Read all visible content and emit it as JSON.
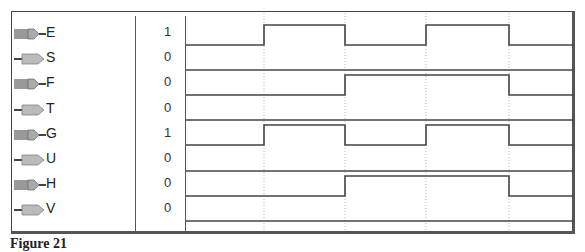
{
  "signals": [
    {
      "name": "E",
      "type": "input",
      "value": "1",
      "wave": [
        0,
        1,
        0,
        1,
        0
      ]
    },
    {
      "name": "S",
      "type": "output",
      "value": "0",
      "wave": [
        0,
        0,
        0,
        0,
        0
      ]
    },
    {
      "name": "F",
      "type": "input",
      "value": "0",
      "wave": [
        0,
        0,
        1,
        1,
        0
      ]
    },
    {
      "name": "T",
      "type": "output",
      "value": "0",
      "wave": [
        0,
        0,
        0,
        0,
        0
      ]
    },
    {
      "name": "G",
      "type": "input",
      "value": "1",
      "wave": [
        0,
        1,
        0,
        1,
        0
      ]
    },
    {
      "name": "U",
      "type": "output",
      "value": "0",
      "wave": [
        0,
        0,
        0,
        0,
        0
      ]
    },
    {
      "name": "H",
      "type": "input",
      "value": "0",
      "wave": [
        0,
        0,
        1,
        1,
        0
      ]
    },
    {
      "name": "V",
      "type": "output",
      "value": "0",
      "wave": [
        0,
        0,
        0,
        0,
        0
      ]
    }
  ],
  "time_marks_px": [
    186,
    264,
    345,
    426,
    509,
    574
  ],
  "colors": {
    "line": "#444444",
    "grid": "#bbbbbb",
    "frame": "#555555"
  },
  "caption": "Figure 21"
}
